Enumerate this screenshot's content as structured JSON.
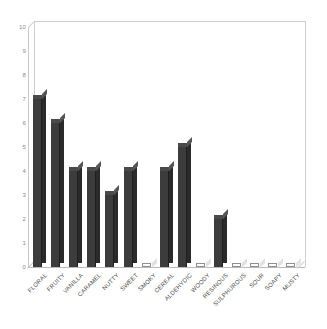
{
  "chart_data": {
    "type": "bar",
    "title": "",
    "subtitle": "",
    "xlabel": "",
    "ylabel": "",
    "ylim": [
      0,
      10
    ],
    "ytick_step": 1,
    "ytick_labels": [
      "10",
      "9",
      "8",
      "7",
      "6",
      "5",
      "4",
      "3",
      "2",
      "1",
      "0"
    ],
    "grid": false,
    "legend": false,
    "legend_position": "none",
    "style": "3d-column",
    "categories": [
      "FLORAL",
      "FRUITY",
      "VANILLA",
      "CARAMEL",
      "NUTTY",
      "SWEET",
      "SMOKY",
      "CEREAL",
      "ALDEHYDIC",
      "WOODY",
      "RESINOUS",
      "SULPHUROUS",
      "SOUR",
      "SOAPY",
      "MUSTY"
    ],
    "values": [
      7,
      6,
      4,
      4,
      3,
      4,
      0,
      4,
      5,
      0,
      2,
      0,
      0,
      0,
      0
    ],
    "xlabel_rotation": -45,
    "colors": {
      "bar_front": "#3c3c3c",
      "bar_side": "#2a2a2a",
      "bar_top": "#4a4a4a",
      "axis_text": "#8a8a8a",
      "category_text": "#4a4a4a",
      "frame": "#cfcfcf",
      "background": "#ffffff"
    }
  }
}
